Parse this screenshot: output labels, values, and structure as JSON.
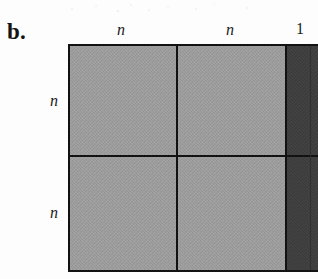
{
  "figure": {
    "panel_label": "b.",
    "type": "block-matrix-partition-diagram",
    "accent_colors": {
      "block_light": "#9a9a9a",
      "block_dark": "#3a3a3a",
      "rule": "#121212",
      "background": "#ffffff"
    }
  },
  "column_labels": [
    {
      "text": "n",
      "style": "italic"
    },
    {
      "text": "n",
      "style": "italic"
    },
    {
      "text": "1",
      "style": "upright"
    }
  ],
  "row_labels": [
    {
      "text": "n",
      "style": "italic"
    },
    {
      "text": "n",
      "style": "italic"
    }
  ],
  "blocks": [
    {
      "row": 0,
      "col": 0,
      "shade": "light",
      "row_label": "n",
      "col_label": "n"
    },
    {
      "row": 0,
      "col": 1,
      "shade": "light",
      "row_label": "n",
      "col_label": "n"
    },
    {
      "row": 0,
      "col": 2,
      "shade": "dark",
      "row_label": "n",
      "col_label": "1"
    },
    {
      "row": 1,
      "col": 0,
      "shade": "light",
      "row_label": "n",
      "col_label": "n"
    },
    {
      "row": 1,
      "col": 1,
      "shade": "light",
      "row_label": "n",
      "col_label": "n"
    },
    {
      "row": 1,
      "col": 2,
      "shade": "dark",
      "row_label": "n",
      "col_label": "1"
    }
  ]
}
